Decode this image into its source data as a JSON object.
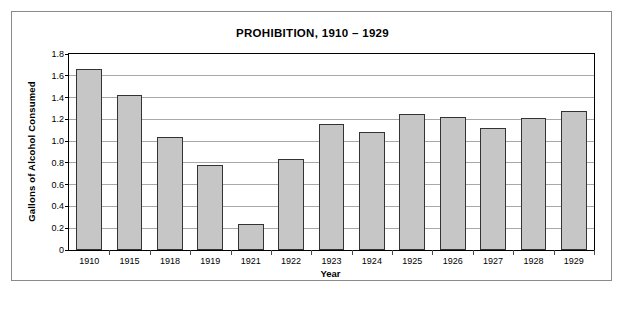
{
  "chart_data": {
    "type": "bar",
    "title": "PROHIBITION, 1910 – 1929",
    "xlabel": "Year",
    "ylabel": "Gallons of Alcohol Consumed",
    "categories": [
      "1910",
      "1915",
      "1918",
      "1919",
      "1921",
      "1922",
      "1923",
      "1924",
      "1925",
      "1926",
      "1927",
      "1928",
      "1929"
    ],
    "values": [
      1.66,
      1.42,
      1.04,
      0.78,
      0.24,
      0.84,
      1.16,
      1.08,
      1.25,
      1.22,
      1.12,
      1.21,
      1.28
    ],
    "ylim": [
      0,
      1.8
    ],
    "ytick_labels": [
      "1.8",
      "1.6",
      "1.4",
      "1.2",
      "1.0",
      "0.8",
      "0.6",
      "0.4",
      "0.2",
      "0"
    ],
    "ytick_values": [
      1.8,
      1.6,
      1.4,
      1.2,
      1.0,
      0.8,
      0.6,
      0.4,
      0.2,
      0
    ],
    "grid": true,
    "legend": null,
    "bar_color": "#c6c6c6",
    "bar_border_color": "#333333",
    "grid_color": "#a8a8a8",
    "axis_color": "#000000"
  },
  "figure": {
    "frame_color": "#8a8a8a",
    "background": "#ffffff"
  },
  "caption": {
    "partial_text": ""
  }
}
